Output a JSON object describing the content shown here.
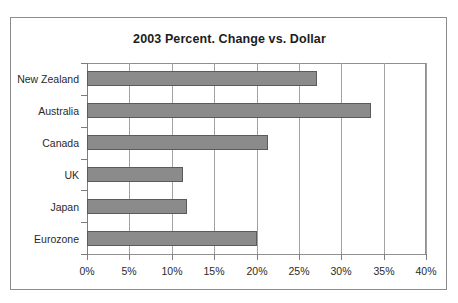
{
  "chart_data": {
    "type": "bar",
    "orientation": "horizontal",
    "title": "2003 Percent. Change vs. Dollar",
    "xlabel": "",
    "ylabel": "",
    "categories": [
      "New Zealand",
      "Australia",
      "Canada",
      "UK",
      "Japan",
      "Eurozone"
    ],
    "values": [
      27.1,
      33.5,
      21.4,
      11.3,
      11.8,
      20.0
    ],
    "xlim": [
      0,
      40
    ],
    "xticks": [
      0,
      5,
      10,
      15,
      20,
      25,
      30,
      35,
      40
    ],
    "xtick_labels": [
      "0%",
      "5%",
      "10%",
      "15%",
      "20%",
      "25%",
      "30%",
      "35%",
      "40%"
    ],
    "grid": true,
    "grid_axis": "x",
    "legend": null,
    "bar_color": "#8b8b8b",
    "bar_edge_color": "#5b5b5b",
    "grid_color": "#a2a2a2",
    "axis_color": "#7d7d7d",
    "frame_color": "#8c8c8c",
    "background_color": "#ffffff",
    "text_color": "#2a2a2a"
  }
}
